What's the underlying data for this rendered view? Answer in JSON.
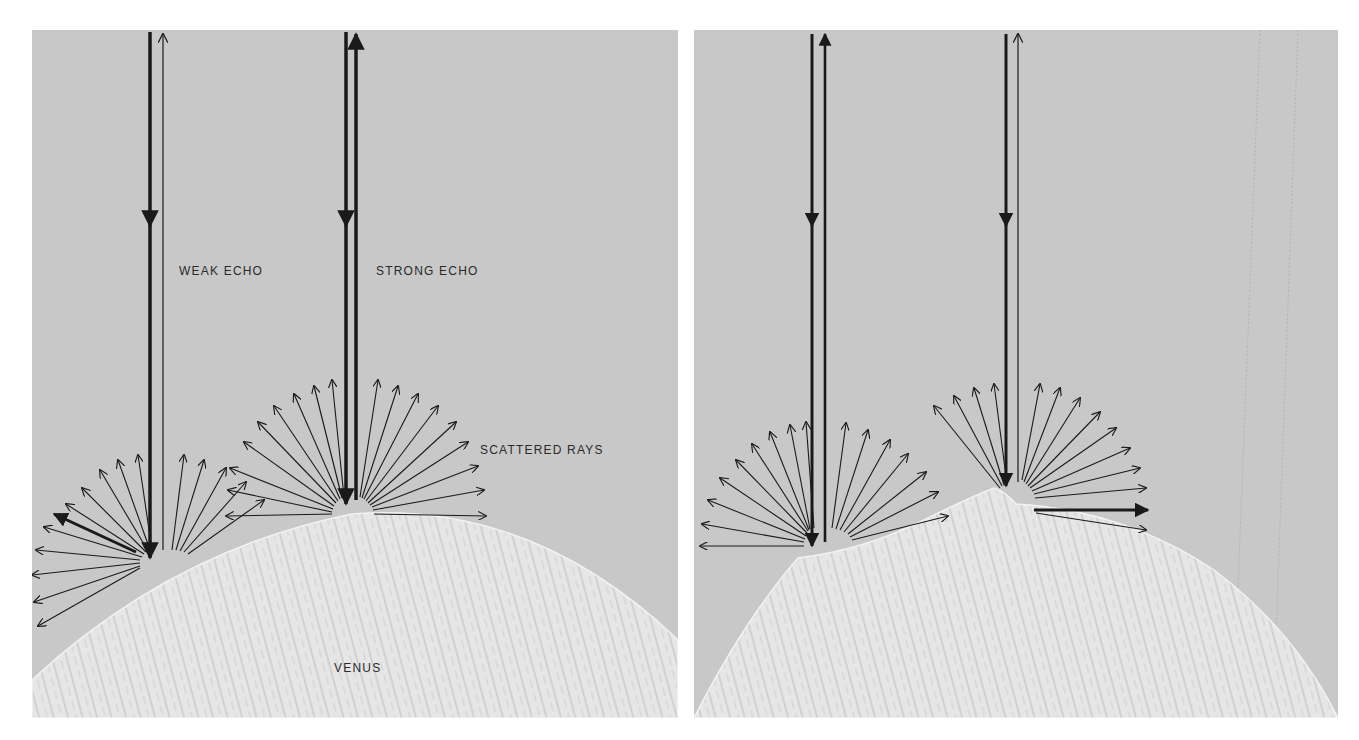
{
  "figure": {
    "panels": [
      {
        "id": "left",
        "labels": {
          "weak_echo": "WEAK ECHO",
          "strong_echo": "STRONG ECHO",
          "scattered_rays": "SCATTERED RAYS",
          "planet": "VENUS"
        }
      },
      {
        "id": "right",
        "labels": {}
      }
    ],
    "colors": {
      "sky": "#c8c8c8",
      "planet": "#e4e4e4",
      "planet_texture": "#b8b8b8",
      "ink": "#1a1a1a"
    }
  }
}
